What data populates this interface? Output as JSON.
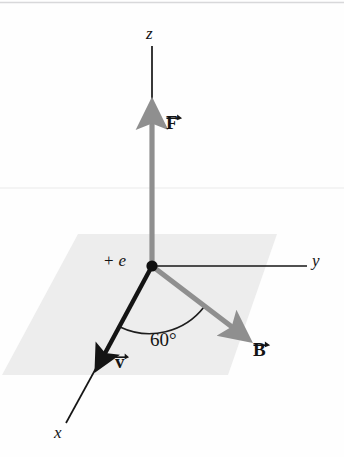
{
  "figure": {
    "title_visible": false,
    "background_color": "#fefefe",
    "plane_fill": "#ededed",
    "vector_gray": "#8f8f8f",
    "vector_black": "#141414",
    "axis_color": "#161616"
  },
  "axes": [
    {
      "name": "z",
      "label": "z",
      "label_x": 146,
      "label_y": 25,
      "direction": "up"
    },
    {
      "name": "y",
      "label": "y",
      "label_x": 312,
      "label_y": 252,
      "direction": "right"
    },
    {
      "name": "x",
      "label": "x",
      "label_x": 54,
      "label_y": 424,
      "direction": "lower-left"
    }
  ],
  "origin": {
    "label": "+ e",
    "plus": "+",
    "symbol": "e",
    "x": 152,
    "y": 266,
    "label_x": 104,
    "label_y": 252
  },
  "vectors": [
    {
      "name": "F",
      "label": "F",
      "color": "#8f8f8f",
      "label_x": 166,
      "label_y": 113,
      "from": [
        152,
        266
      ],
      "to": [
        152,
        108
      ],
      "description": "force vector along +z"
    },
    {
      "name": "B",
      "label": "B",
      "color": "#8f8f8f",
      "label_x": 253,
      "label_y": 340,
      "from": [
        152,
        266
      ],
      "to": [
        243,
        335
      ],
      "description": "magnetic field vector in xy-plane"
    },
    {
      "name": "v",
      "label": "v",
      "color": "#141414",
      "label_x": 115,
      "label_y": 352,
      "from": [
        152,
        266
      ],
      "to": [
        96,
        369
      ],
      "description": "velocity vector in xy-plane toward +x"
    }
  ],
  "angle": {
    "value": "60°",
    "label_x": 150,
    "label_y": 330,
    "between": [
      "v",
      "B"
    ]
  },
  "plane": {
    "name": "xy-plane",
    "points": "78,234 277,234 228,375 2,375"
  }
}
